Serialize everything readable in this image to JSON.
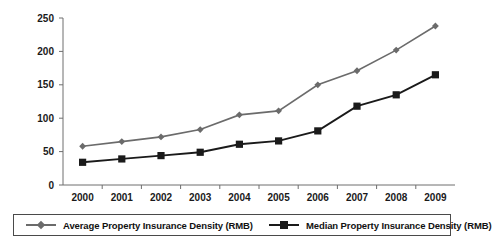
{
  "chart_data": {
    "type": "line",
    "title": "",
    "xlabel": "",
    "ylabel": "",
    "categories": [
      "2000",
      "2001",
      "2002",
      "2003",
      "2004",
      "2005",
      "2006",
      "2007",
      "2008",
      "2009"
    ],
    "series": [
      {
        "name": "Average Property Insurance Density (RMB)",
        "color": "#6b6b6b",
        "marker": "diamond",
        "values": [
          58,
          65,
          72,
          83,
          105,
          111,
          150,
          171,
          202,
          238
        ]
      },
      {
        "name": "Median Property Insurance Density (RMB)",
        "color": "#1a1a1a",
        "marker": "square",
        "values": [
          34,
          39,
          44,
          49,
          61,
          66,
          81,
          118,
          135,
          165
        ]
      }
    ],
    "ylim": [
      0,
      250
    ],
    "yticks": [
      0,
      50,
      100,
      150,
      200,
      250
    ],
    "ytick_labels": [
      "0",
      "50",
      "100",
      "150",
      "200",
      "250"
    ],
    "grid": false,
    "legend_position": "bottom"
  },
  "legend": {
    "entries": [
      {
        "label": "Average Property Insurance Density (RMB)"
      },
      {
        "label": "Median Property Insurance Density (RMB)"
      }
    ]
  }
}
